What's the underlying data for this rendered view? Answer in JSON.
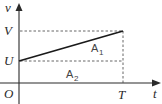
{
  "diagram": {
    "axes": {
      "y_label": "v",
      "x_label": "t",
      "origin_label": "O"
    },
    "y_markers": [
      {
        "label": "V",
        "value": "V"
      },
      {
        "label": "U",
        "value": "U"
      }
    ],
    "x_markers": [
      {
        "label": "T",
        "value": "T"
      }
    ],
    "regions": [
      {
        "label": "A",
        "subscript": "1",
        "description": "triangle between line and U level"
      },
      {
        "label": "A",
        "subscript": "2",
        "description": "rectangle below U level"
      }
    ],
    "line": {
      "from": [
        "0",
        "U"
      ],
      "to": [
        "T",
        "V"
      ]
    }
  }
}
